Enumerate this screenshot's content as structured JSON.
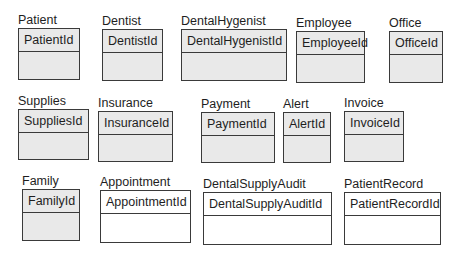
{
  "diagram": {
    "type": "entity-diagram",
    "entities": [
      {
        "name": "Patient",
        "key": "PatientId",
        "style": "shaded"
      },
      {
        "name": "Dentist",
        "key": "DentistId",
        "style": "shaded"
      },
      {
        "name": "DentalHygenist",
        "key": "DentalHygenistId",
        "style": "shaded"
      },
      {
        "name": "Employee",
        "key": "EmployeeId",
        "style": "shaded"
      },
      {
        "name": "Office",
        "key": "OfficeId",
        "style": "shaded"
      },
      {
        "name": "Supplies",
        "key": "SuppliesId",
        "style": "shaded"
      },
      {
        "name": "Insurance",
        "key": "InsuranceId",
        "style": "shaded"
      },
      {
        "name": "Payment",
        "key": "PaymentId",
        "style": "shaded"
      },
      {
        "name": "Alert",
        "key": "AlertId",
        "style": "shaded"
      },
      {
        "name": "Invoice",
        "key": "InvoiceId",
        "style": "shaded"
      },
      {
        "name": "Family",
        "key": "FamilyId",
        "style": "shaded"
      },
      {
        "name": "Appointment",
        "key": "AppointmentId",
        "style": "plain"
      },
      {
        "name": "DentalSupplyAudit",
        "key": "DentalSupplyAuditId",
        "style": "plain"
      },
      {
        "name": "PatientRecord",
        "key": "PatientRecordId",
        "style": "plain"
      }
    ]
  }
}
